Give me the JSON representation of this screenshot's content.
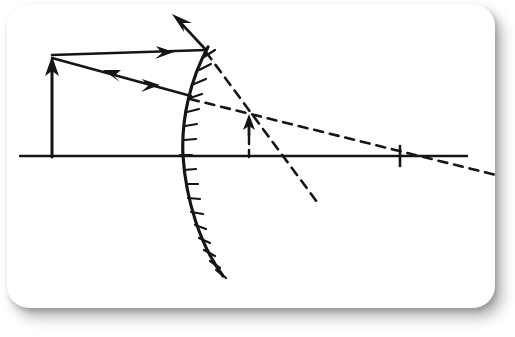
{
  "figure": {
    "kind": "optics-ray-diagram",
    "background_color": "#ffffff",
    "ink_color": "#151515",
    "card": {
      "x": 7,
      "y": 4,
      "width": 488,
      "height": 304,
      "corner_radius": 22,
      "fill": "#ffffff",
      "shadow_color": "rgba(0,0,0,0.30)"
    },
    "canvas": {
      "width": 515,
      "height": 337
    }
  },
  "chart_data": {
    "type": "line",
    "title": "",
    "xlabel": "",
    "ylabel": "",
    "grid": false,
    "legend": null,
    "axis_ranges": {
      "x": [
        0,
        515
      ],
      "y": [
        0,
        337
      ]
    },
    "elements": [
      {
        "name": "principal-axis",
        "role": "optical-axis",
        "style": "solid",
        "stroke_width": 2.4,
        "points": [
          [
            20,
            156
          ],
          [
            467,
            156
          ]
        ]
      },
      {
        "name": "object-arrow-shaft",
        "role": "object",
        "style": "solid",
        "stroke_width": 3.0,
        "points": [
          [
            52,
            157
          ],
          [
            52,
            68
          ]
        ]
      },
      {
        "name": "object-arrow-head",
        "role": "object-tip",
        "direction": "up",
        "tip": [
          52,
          58
        ],
        "half_width": 7,
        "length": 18
      },
      {
        "name": "incident-ray-parallel",
        "role": "incident-ray-1",
        "style": "solid",
        "stroke_width": 2.6,
        "points": [
          [
            52,
            55
          ],
          [
            206,
            50
          ]
        ]
      },
      {
        "name": "incident-ray-parallel-arrowhead",
        "role": "ray-direction-marker",
        "direction": "right",
        "tip": [
          172,
          53
        ],
        "half_width": 6,
        "length": 16
      },
      {
        "name": "incident-ray-oblique",
        "role": "incident-ray-2",
        "style": "solid",
        "stroke_width": 2.6,
        "points": [
          [
            52,
            58
          ],
          [
            191,
            96
          ]
        ]
      },
      {
        "name": "incident-ray-oblique-arrowhead-left",
        "role": "ray-direction-marker",
        "direction": "left",
        "tip": [
          104,
          70
        ],
        "half_width": 6,
        "length": 16
      },
      {
        "name": "incident-ray-oblique-arrowhead-right",
        "role": "ray-direction-marker",
        "direction": "right",
        "tip": [
          158,
          84
        ],
        "half_width": 6,
        "length": 16
      },
      {
        "name": "reflected-ray-upward",
        "role": "reflected-ray-1",
        "style": "solid",
        "stroke_width": 2.6,
        "points": [
          [
            206,
            50
          ],
          [
            178,
            20
          ]
        ]
      },
      {
        "name": "reflected-ray-upward-arrowhead",
        "role": "ray-direction-marker",
        "direction": "up-left",
        "tip": [
          173,
          15
        ],
        "half_width": 6,
        "length": 18
      },
      {
        "name": "mirror-arc",
        "role": "convex-mirror-surface",
        "style": "solid",
        "stroke_width": 3.2,
        "vertex": [
          183,
          156
        ],
        "top_end": [
          208,
          47
        ],
        "bottom_end": [
          223,
          276
        ],
        "bulge": "left",
        "path": "M 208 47 C 191 78 181 118 183 156 C 186 200 200 245 223 276"
      },
      {
        "name": "mirror-hatching",
        "role": "mirror-back-hatching",
        "count": 17,
        "stroke_width": 2.2,
        "side": "right",
        "length": 13
      },
      {
        "name": "virtual-ray-from-top-reflection",
        "role": "virtual-extension-1",
        "style": "dashed",
        "stroke_width": 2.6,
        "dash": "9,7",
        "points": [
          [
            206,
            52
          ],
          [
            320,
            206
          ]
        ]
      },
      {
        "name": "virtual-ray-through-focus",
        "role": "virtual-extension-2",
        "style": "dashed",
        "stroke_width": 2.6,
        "dash": "9,7",
        "points": [
          [
            190,
            99
          ],
          [
            500,
            176
          ]
        ]
      },
      {
        "name": "image-arrow-shaft",
        "role": "virtual-image",
        "style": "solid",
        "stroke_width": 2.8,
        "points": [
          [
            249,
            135
          ],
          [
            249,
            124
          ]
        ]
      },
      {
        "name": "image-arrow-head",
        "role": "virtual-image-tip",
        "direction": "up",
        "tip": [
          249,
          116
        ],
        "half_width": 5,
        "length": 13
      },
      {
        "name": "image-arrow-dashed-stem",
        "role": "virtual-image-stem",
        "style": "dashed",
        "stroke_width": 2.4,
        "dash": "7,6",
        "points": [
          [
            249,
            136
          ],
          [
            249,
            157
          ]
        ]
      },
      {
        "name": "focal-point-tick",
        "role": "focal-point-marker",
        "style": "solid",
        "stroke_width": 2.6,
        "points": [
          [
            400,
            146
          ],
          [
            400,
            166
          ]
        ],
        "axis_x": 400
      }
    ]
  }
}
